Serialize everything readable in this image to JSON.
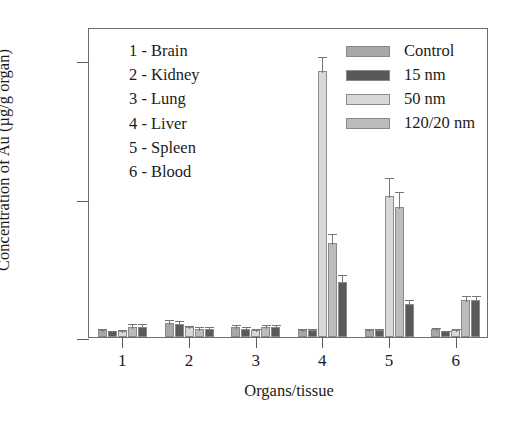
{
  "chart_data": {
    "type": "bar",
    "title": "",
    "xlabel": "Organs/tissue",
    "ylabel": "Concentration of Au (µg/g organ)",
    "categories": [
      "1",
      "2",
      "3",
      "4",
      "5",
      "6"
    ],
    "category_names": [
      "Brain",
      "Kidney",
      "Lung",
      "Liver",
      "Spleen",
      "Blood"
    ],
    "ylim": [
      0,
      11.2
    ],
    "yticks": [
      0,
      5,
      10
    ],
    "ytick_labels": [
      "0",
      "5",
      "10"
    ],
    "xticks": [
      1,
      2,
      3,
      4,
      5,
      6
    ],
    "grid": false,
    "legend_position": "top-right",
    "error_bars": true,
    "series": [
      {
        "name": "Control",
        "color": "#a8a8a8",
        "values": [
          0.25,
          0.5,
          0.35,
          0.25,
          0.25,
          0.3
        ],
        "errors": [
          0.12,
          0.2,
          0.14,
          0.1,
          0.12,
          0.1
        ]
      },
      {
        "name": "15 nm",
        "color": "#595959",
        "values": [
          0.2,
          0.48,
          0.3,
          0.25,
          0.25,
          0.2
        ],
        "errors": [
          0.1,
          0.16,
          0.15,
          0.1,
          0.12,
          0.08
        ]
      },
      {
        "name": "50 nm",
        "color": "#d8d8d8",
        "values": [
          0.2,
          0.35,
          0.25,
          9.6,
          5.1,
          0.25
        ],
        "errors": [
          0.12,
          0.12,
          0.12,
          0.6,
          0.7,
          0.1
        ]
      },
      {
        "name": "120/20 nm",
        "color": "#bcbcbc",
        "values": [
          0.35,
          0.3,
          0.35,
          3.4,
          4.7,
          1.35
        ],
        "errors": [
          0.18,
          0.12,
          0.14,
          0.4,
          0.6,
          0.22
        ]
      }
    ],
    "extra_series": [
      {
        "name": "15 nm",
        "color": "#595959",
        "note": "dark bar trailing each group",
        "values": [
          0.35,
          0.3,
          0.35,
          2.0,
          1.2,
          1.35
        ],
        "errors": [
          0.18,
          0.12,
          0.14,
          0.3,
          0.22,
          0.22
        ]
      }
    ]
  },
  "organ_key": {
    "entries": [
      "1 - Brain",
      "2 - Kidney",
      "3 - Lung",
      "4 - Liver",
      "5 - Spleen",
      "6 - Blood"
    ]
  }
}
